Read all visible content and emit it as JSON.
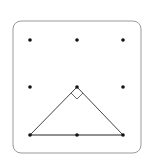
{
  "diagram": {
    "type": "geoboard-3x3",
    "frame": {
      "x": 13,
      "y": 21,
      "width": 128,
      "height": 132,
      "radius": 8,
      "stroke": "#9a9a9a"
    },
    "grid": {
      "columns_x": [
        30,
        77,
        123
      ],
      "rows_y": [
        40,
        87,
        135
      ],
      "dot_color": "#111111",
      "dot_radius": 1.8
    },
    "triangle": {
      "vertices": [
        [
          30,
          135
        ],
        [
          77,
          87
        ],
        [
          123,
          135
        ]
      ],
      "stroke": "#444444",
      "base_stroke": "#222222",
      "right_angle_at": [
        77,
        87
      ],
      "right_angle_marker_size": 6
    }
  }
}
